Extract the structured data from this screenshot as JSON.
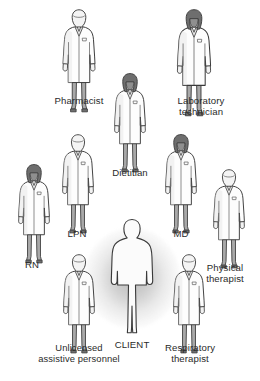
{
  "diagram": {
    "type": "radial-team-diagram",
    "palette": {
      "coat_fill": "#fdfdfd",
      "coat_shade": "#ededed",
      "outline": "#3a3a3a",
      "pants_light": "#a9a9a9",
      "pants_dark": "#8e8e8e",
      "hair_light": "#f2f2f2",
      "hair_dark": "#6e6e6e",
      "skin": "#f4f4f4",
      "label_color": "#2a2a2a",
      "glow_color": "#8c8c8c",
      "background": "#ffffff"
    },
    "center": {
      "label": "CLIENT",
      "icon": "client-silhouette-icon",
      "hair": "none",
      "coat": "none",
      "highlighted": true
    },
    "members": [
      {
        "id": "pharmacist",
        "label": "Pharmacist",
        "icon": "staff-figure-icon",
        "hair": "light",
        "coat": "lab-coat",
        "pants": "light"
      },
      {
        "id": "laboratory-technician",
        "label": "Laboratory\ntechnician",
        "icon": "staff-figure-icon",
        "hair": "dark",
        "coat": "lab-coat",
        "pants": "dark"
      },
      {
        "id": "dietitian",
        "label": "Dietitian",
        "icon": "staff-figure-icon",
        "hair": "dark",
        "coat": "lab-coat",
        "pants": "dark"
      },
      {
        "id": "rn",
        "label": "RN",
        "icon": "staff-figure-icon",
        "hair": "dark",
        "coat": "lab-coat",
        "pants": "dark"
      },
      {
        "id": "lpn",
        "label": "LPN",
        "icon": "staff-figure-icon",
        "hair": "light",
        "coat": "lab-coat",
        "pants": "light"
      },
      {
        "id": "md",
        "label": "MD",
        "icon": "staff-figure-icon",
        "hair": "dark",
        "coat": "lab-coat",
        "pants": "dark"
      },
      {
        "id": "physical-therapist",
        "label": "Physical\ntherapist",
        "icon": "staff-figure-icon",
        "hair": "light",
        "coat": "lab-coat",
        "pants": "dark"
      },
      {
        "id": "unlicensed-assistive-personnel",
        "label": "Unlicensed\nassistive personnel",
        "icon": "staff-figure-icon",
        "hair": "light",
        "coat": "lab-coat",
        "pants": "dark"
      },
      {
        "id": "respiratory-therapist",
        "label": "Respiratory\ntherapist",
        "icon": "staff-figure-icon",
        "hair": "light",
        "coat": "lab-coat",
        "pants": "light"
      }
    ]
  }
}
